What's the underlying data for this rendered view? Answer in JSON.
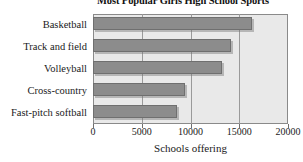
{
  "chart_data": {
    "type": "bar",
    "orientation": "horizontal",
    "title": "Most Popular Girls High School Sports",
    "xlabel": "Schools offering",
    "ylabel": "",
    "categories": [
      "Basketball",
      "Track and field",
      "Volleyball",
      "Cross-country",
      "Fast-pitch softball"
    ],
    "values": [
      16300,
      14200,
      13200,
      9400,
      8600
    ],
    "xlim": [
      0,
      20000
    ],
    "xticks": [
      0,
      5000,
      10000,
      15000,
      20000
    ],
    "xtick_labels": [
      "0",
      "5000",
      "10000",
      "15000",
      "20000"
    ],
    "grid": true,
    "grid_axis": "x",
    "legend": null,
    "bar_color": "#8c8c8c",
    "bar_edge_color": "#6f6f6f",
    "plot_background": "#e9e9e9",
    "figure_background": "#ffffff",
    "axis_color": "#8a8a8a"
  },
  "figure": {
    "title": "Most Popular Girls High School Sports",
    "corner_mark": "",
    "axis": {
      "x_label": "Schools offering",
      "ticks": [
        {
          "label": "0",
          "value": 0
        },
        {
          "label": "5000",
          "value": 5000
        },
        {
          "label": "10000",
          "value": 10000
        },
        {
          "label": "15000",
          "value": 15000
        },
        {
          "label": "20000",
          "value": 20000
        }
      ]
    },
    "bars": [
      {
        "label": "Basketball",
        "value": 16300
      },
      {
        "label": "Track and field",
        "value": 14200
      },
      {
        "label": "Volleyball",
        "value": 13200
      },
      {
        "label": "Cross-country",
        "value": 9400
      },
      {
        "label": "Fast-pitch softball",
        "value": 8600
      }
    ]
  }
}
